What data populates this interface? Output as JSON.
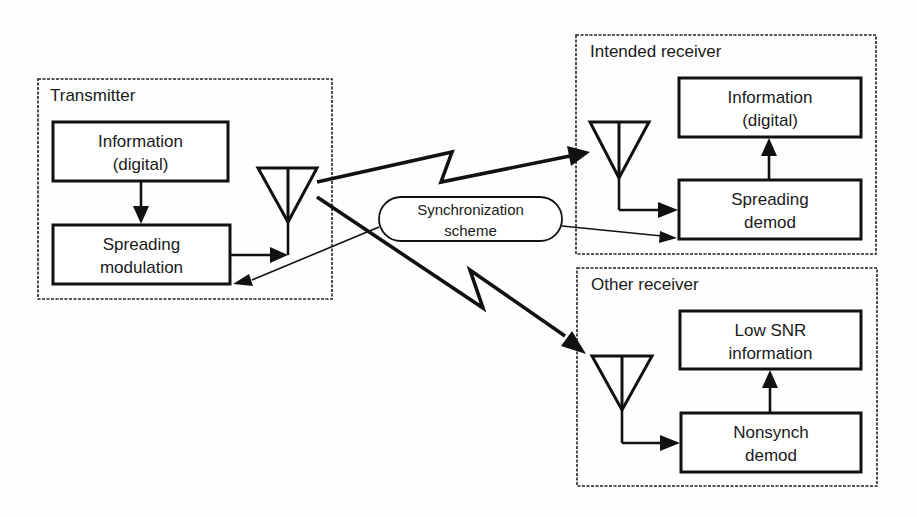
{
  "diagram": {
    "transmitter": {
      "title": "Transmitter",
      "blocks": [
        {
          "line1": "Information",
          "line2": "(digital)"
        },
        {
          "line1": "Spreading",
          "line2": "modulation"
        }
      ]
    },
    "sync": {
      "line1": "Synchronization",
      "line2": "scheme"
    },
    "intended_receiver": {
      "title": "Intended receiver",
      "blocks": [
        {
          "line1": "Information",
          "line2": "(digital)"
        },
        {
          "line1": "Spreading",
          "line2": "demod"
        }
      ]
    },
    "other_receiver": {
      "title": "Other receiver",
      "blocks": [
        {
          "line1": "Low SNR",
          "line2": "information"
        },
        {
          "line1": "Nonsynch",
          "line2": "demod"
        }
      ]
    },
    "icons": {
      "antenna": "antenna-icon",
      "radio_link": "lightning-zigzag-arrow"
    },
    "colors": {
      "ink": "#111111",
      "background": "#fefefe"
    }
  }
}
